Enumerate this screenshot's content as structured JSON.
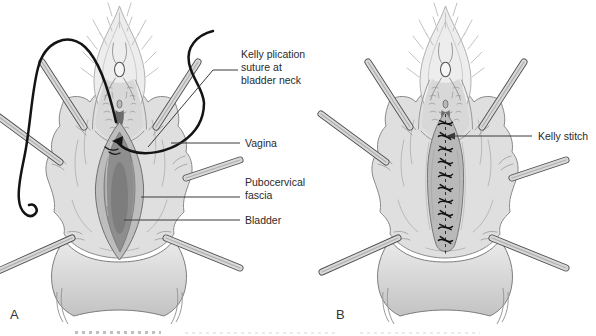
{
  "panels": {
    "a": {
      "letter": "A"
    },
    "b": {
      "letter": "B"
    }
  },
  "labels": {
    "kelly_plication": "Kelly plication\nsuture at\nbladder neck",
    "vagina": "Vagina",
    "pubocervical_fascia": "Pubocervical\nfascia",
    "bladder": "Bladder",
    "kelly_stitch": "Kelly stitch"
  },
  "colors": {
    "background": "#ffffff",
    "ink": "#2a2a2a",
    "leader": "#3a3a3a",
    "tissue": "#dfdfdf",
    "tissue_light": "#ededed",
    "tissue_shadow": "#c6c6c6",
    "fascia": "#bdbdbd",
    "bladder": "#8e8e8e",
    "bladder_dark": "#757575",
    "retractor": "#d9d9d9",
    "retractor_edge": "#505050",
    "thread": "#141414",
    "outline": "#7a7a7a",
    "sutured_ridge": "#b9b9b9"
  }
}
